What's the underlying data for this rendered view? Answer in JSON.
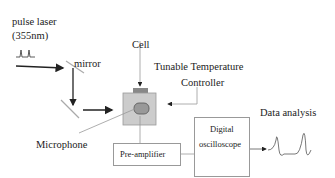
{
  "diagram": {
    "labels": {
      "laser_line1": "pulse laser",
      "laser_line2": "(355nm)",
      "mirror": "mirror",
      "cell": "Cell",
      "controller_line1": "Tunable Temperature",
      "controller_line2": "Controller",
      "microphone": "Microphone",
      "preamp": "Pre-amplifier",
      "scope_line1": "Digital",
      "scope_line2": "oscilloscope",
      "data_analysis": "Data analysis"
    },
    "colors": {
      "line": "#222222",
      "mirror": "#aaaaaa",
      "cell_body": "#cccccc",
      "cell_lid": "#888888",
      "sample": "#999999",
      "box_border": "#999999"
    }
  }
}
